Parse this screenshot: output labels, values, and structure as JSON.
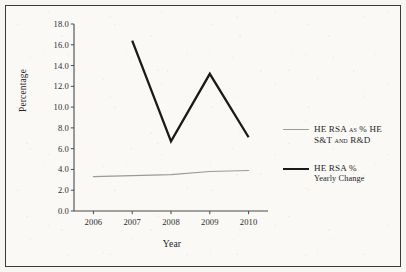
{
  "figure": {
    "background_color": "#faf9f6",
    "border_color": "#3a3a38"
  },
  "chart_data": {
    "type": "line",
    "title": "",
    "xlabel": "Year",
    "ylabel": "Percentage",
    "categories": [
      "2006",
      "2007",
      "2008",
      "2009",
      "2010"
    ],
    "x": [
      2006,
      2007,
      2008,
      2009,
      2010
    ],
    "ylim": [
      0.0,
      18.0
    ],
    "ytick_step": 2.0,
    "ytick_labels": [
      "0.0",
      "2.0",
      "4.0",
      "6.0",
      "8.0",
      "10.0",
      "12.0",
      "14.0",
      "16.0",
      "18.0"
    ],
    "ytick_values": [
      0.0,
      2.0,
      4.0,
      6.0,
      8.0,
      10.0,
      12.0,
      14.0,
      16.0,
      18.0
    ],
    "xtick_labels": [
      "2006",
      "2007",
      "2008",
      "2009",
      "2010"
    ],
    "grid": false,
    "legend_position": "right-outside",
    "series": [
      {
        "name": "HE RSA as % HE S&T and R&D",
        "legend_line1": "HE RSA as % HE",
        "legend_line2": "S&T and R&D",
        "color": "#9a9a97",
        "width": 1.2,
        "values": [
          3.3,
          3.4,
          3.5,
          3.8,
          3.9
        ]
      },
      {
        "name": "HE RSA % Yearly Change",
        "legend_line1": "HE RSA %",
        "legend_line2": "Yearly Change",
        "color": "#1a1a18",
        "width": 2.3,
        "values": [
          null,
          16.4,
          6.7,
          13.2,
          7.1
        ]
      }
    ]
  },
  "axes": {
    "y_title": "Percentage",
    "x_title": "Year"
  }
}
